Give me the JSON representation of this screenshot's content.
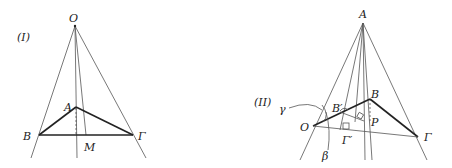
{
  "figures": [
    {
      "id": "I",
      "label": "(I)",
      "points": {
        "O": "O",
        "A": "A",
        "B": "B",
        "G": "Γ",
        "M": "M"
      }
    },
    {
      "id": "II",
      "label": "(II)",
      "points": {
        "A": "A",
        "B": "B",
        "Bp": "B′",
        "O": "O",
        "P": "P",
        "G": "Γ",
        "Gp": "Γ′",
        "gamma": "γ",
        "beta": "β"
      }
    }
  ]
}
